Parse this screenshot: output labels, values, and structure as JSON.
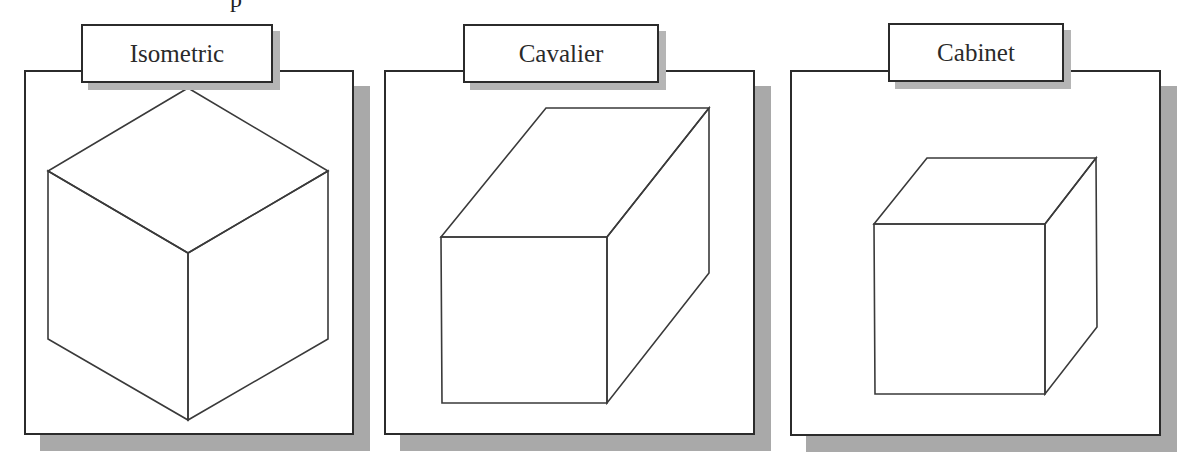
{
  "figure": {
    "caption_fragment": "p",
    "panels": [
      {
        "id": "isometric",
        "label": "Isometric",
        "projection": "isometric",
        "box": {
          "x": 24,
          "y": 70,
          "w": 330,
          "h": 365
        },
        "label_box": {
          "x": 81,
          "y": 24,
          "w": 192,
          "h": 59
        },
        "edges": [
          [
            [
              188,
              88
            ],
            [
              328,
              171
            ]
          ],
          [
            [
              328,
              171
            ],
            [
              188,
              253
            ]
          ],
          [
            [
              188,
              253
            ],
            [
              48,
              171
            ]
          ],
          [
            [
              48,
              171
            ],
            [
              188,
              88
            ]
          ],
          [
            [
              48,
              171
            ],
            [
              48,
              339
            ]
          ],
          [
            [
              48,
              339
            ],
            [
              188,
              420
            ]
          ],
          [
            [
              188,
              420
            ],
            [
              328,
              339
            ]
          ],
          [
            [
              328,
              339
            ],
            [
              328,
              171
            ]
          ],
          [
            [
              188,
              253
            ],
            [
              188,
              420
            ]
          ]
        ]
      },
      {
        "id": "cavalier",
        "label": "Cavalier",
        "projection": "cavalier",
        "box": {
          "x": 384,
          "y": 70,
          "w": 371,
          "h": 365
        },
        "label_box": {
          "x": 463,
          "y": 24,
          "w": 196,
          "h": 59
        },
        "edges": [
          [
            [
              441,
              237
            ],
            [
              607,
              237
            ]
          ],
          [
            [
              607,
              237
            ],
            [
              607,
              403
            ]
          ],
          [
            [
              607,
              403
            ],
            [
              442,
              403
            ]
          ],
          [
            [
              442,
              403
            ],
            [
              441,
              237
            ]
          ],
          [
            [
              441,
              237
            ],
            [
              546,
              108
            ]
          ],
          [
            [
              546,
              108
            ],
            [
              709,
              108
            ]
          ],
          [
            [
              709,
              108
            ],
            [
              607,
              237
            ]
          ],
          [
            [
              709,
              108
            ],
            [
              709,
              273
            ]
          ],
          [
            [
              709,
              273
            ],
            [
              607,
              403
            ]
          ]
        ]
      },
      {
        "id": "cabinet",
        "label": "Cabinet",
        "projection": "cabinet",
        "box": {
          "x": 790,
          "y": 70,
          "w": 371,
          "h": 366
        },
        "label_box": {
          "x": 888,
          "y": 23,
          "w": 176,
          "h": 59
        },
        "edges": [
          [
            [
              874,
              224
            ],
            [
              1045,
              224
            ]
          ],
          [
            [
              1045,
              224
            ],
            [
              1045,
              394
            ]
          ],
          [
            [
              1045,
              394
            ],
            [
              875,
              394
            ]
          ],
          [
            [
              875,
              394
            ],
            [
              874,
              224
            ]
          ],
          [
            [
              874,
              224
            ],
            [
              927,
              158
            ]
          ],
          [
            [
              927,
              158
            ],
            [
              1096,
              158
            ]
          ],
          [
            [
              1096,
              158
            ],
            [
              1045,
              224
            ]
          ],
          [
            [
              1096,
              158
            ],
            [
              1097,
              327
            ]
          ],
          [
            [
              1097,
              327
            ],
            [
              1045,
              394
            ]
          ]
        ]
      }
    ],
    "colors": {
      "line": "#3a3a3a",
      "panel_shadow": "#a9a9a9",
      "label_shadow": "#b5b5b5",
      "background": "#ffffff"
    }
  }
}
